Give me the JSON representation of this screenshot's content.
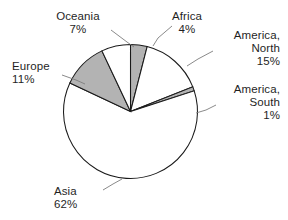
{
  "chart_data": {
    "type": "pie",
    "title": "",
    "subtitle": "",
    "xlabel": "",
    "ylabel": "",
    "legend_position": "none",
    "grid": false,
    "start_angle_deg": 0,
    "direction": "clockwise",
    "categories": [
      "Africa",
      "America, North",
      "America, South",
      "Asia",
      "Europe",
      "Oceania"
    ],
    "values": [
      4,
      15,
      1,
      62,
      11,
      7
    ],
    "value_unit": "%",
    "slices": [
      {
        "name": "Africa",
        "label": "Africa",
        "value": 4,
        "pct_text": "4%",
        "fill": "#b3b3b3",
        "start_deg": 0,
        "end_deg": 14.4,
        "label_align": "center"
      },
      {
        "name": "America, North",
        "label": "America,",
        "label_line2": "North",
        "value": 15,
        "pct_text": "15%",
        "fill": "#ffffff",
        "start_deg": 14.4,
        "end_deg": 68.4,
        "label_align": "right"
      },
      {
        "name": "America, South",
        "label": "America,",
        "label_line2": "South",
        "value": 1,
        "pct_text": "1%",
        "fill": "#b3b3b3",
        "start_deg": 68.4,
        "end_deg": 72.0,
        "label_align": "right"
      },
      {
        "name": "Asia",
        "label": "Asia",
        "value": 62,
        "pct_text": "62%",
        "fill": "#ffffff",
        "start_deg": 72.0,
        "end_deg": 295.2,
        "label_align": "left"
      },
      {
        "name": "Europe",
        "label": "Europe",
        "value": 11,
        "pct_text": "11%",
        "fill": "#b3b3b3",
        "start_deg": 295.2,
        "end_deg": 334.8,
        "label_align": "left"
      },
      {
        "name": "Oceania",
        "label": "Oceania",
        "value": 7,
        "pct_text": "7%",
        "fill": "#ffffff",
        "start_deg": 334.8,
        "end_deg": 360.0,
        "label_align": "center"
      }
    ],
    "colors": {
      "shaded_slice": "#b3b3b3",
      "plain_slice": "#ffffff",
      "outline": "#1a1a1a",
      "leader_line": "#7d7d7d",
      "text": "#1f1f1f",
      "background": "#ffffff"
    }
  }
}
